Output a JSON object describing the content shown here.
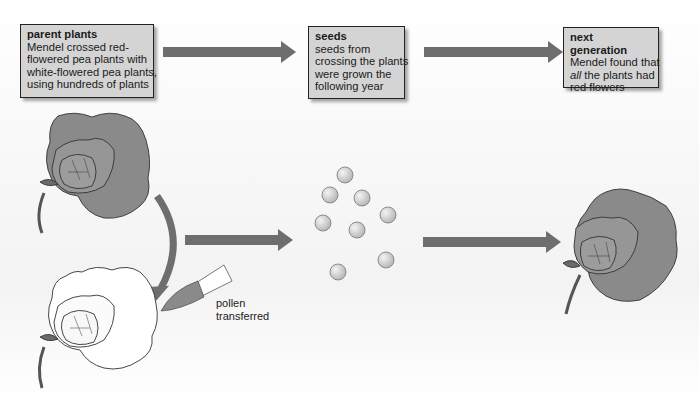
{
  "stages": [
    {
      "title": "parent plants",
      "lines": [
        "Mendel crossed red-",
        "flowered pea plants with",
        "white-flowered pea plants,",
        "using hundreds of plants"
      ]
    },
    {
      "title": "seeds",
      "lines": [
        "seeds from",
        "crossing the plants",
        "were grown the",
        "following year"
      ]
    },
    {
      "title": "next generation",
      "lines_prefix": "Mendel found that",
      "emphasis": "all",
      "after_emphasis": " the plants had",
      "last_line": "red flowers"
    }
  ],
  "pollen_label": [
    "pollen",
    "transferred"
  ],
  "colors": {
    "arrow": "#6e6e6e",
    "red_flower": "#8a8a8a",
    "white_flower": "#ffffff",
    "box_fill": "#d4d4d4",
    "seed": "#d8d8d8"
  },
  "illustrations": {
    "left_top": "red-flowered-pea-plant",
    "left_bottom": "white-flowered-pea-plant",
    "brush": "paintbrush",
    "seeds_count": 8,
    "right": "red-flowered-offspring"
  }
}
